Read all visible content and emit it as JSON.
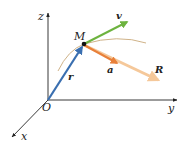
{
  "figure": {
    "type": "kinematics-vector-diagram",
    "axes": {
      "x_label": "x",
      "y_label": "y",
      "z_label": "z",
      "origin_label": "O"
    },
    "point": {
      "label": "M"
    },
    "vectors": [
      {
        "id": "r",
        "label": "r",
        "meaning": "position vector",
        "color": "#3a6fb0"
      },
      {
        "id": "v",
        "label": "v",
        "meaning": "velocity",
        "color": "#6db33f"
      },
      {
        "id": "a",
        "label": "a",
        "meaning": "acceleration",
        "color": "#e8803a"
      },
      {
        "id": "R",
        "label": "R",
        "meaning": "resultant force",
        "color": "#f5c89a"
      }
    ],
    "trajectory": {
      "color": "#c9a97a"
    }
  }
}
